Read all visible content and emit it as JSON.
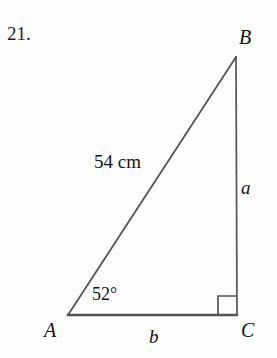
{
  "figure": {
    "problem_number": "21.",
    "background_color": "#fdfdfd",
    "stroke_color": "#555555",
    "text_color": "#1a1a1a",
    "shape": "right-triangle",
    "vertices": {
      "A": {
        "label": "A",
        "x": 68,
        "y": 315
      },
      "B": {
        "label": "B",
        "x": 236,
        "y": 57
      },
      "C": {
        "label": "C",
        "x": 237,
        "y": 315
      }
    },
    "sides": {
      "hypotenuse": {
        "from": "A",
        "to": "B",
        "label": "54 cm",
        "length_value": 54,
        "unit": "cm"
      },
      "opposite": {
        "from": "B",
        "to": "C",
        "label": "a"
      },
      "adjacent": {
        "from": "A",
        "to": "C",
        "label": "b"
      }
    },
    "angles": {
      "at_A": {
        "label": "52°",
        "value": 52,
        "unit": "degrees"
      },
      "at_C": {
        "label": "right-angle-marker",
        "value": 90,
        "unit": "degrees"
      }
    },
    "right_angle_marker": {
      "x": 218,
      "y": 296,
      "size": 18
    }
  }
}
